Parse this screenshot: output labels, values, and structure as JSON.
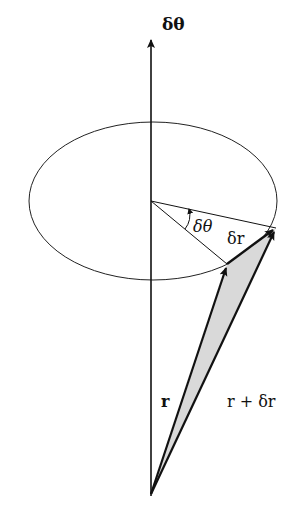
{
  "diagram": {
    "labels": {
      "axis": "δθ",
      "angle": "δθ",
      "delta_r": "δr",
      "r": "r",
      "r_plus_dr": "r + δr"
    },
    "elements": [
      {
        "type": "axis-arrow",
        "label": "δθ",
        "direction": "up"
      },
      {
        "type": "ellipse",
        "description": "circle of rotation in perspective"
      },
      {
        "type": "vector",
        "label": "r",
        "from": "origin",
        "to": "point on circle"
      },
      {
        "type": "vector",
        "label": "r + δr",
        "from": "origin",
        "to": "rotated point on circle"
      },
      {
        "type": "vector",
        "label": "δr",
        "from": "tip of r",
        "to": "tip of r + δr"
      },
      {
        "type": "angle-arc",
        "label": "δθ"
      }
    ],
    "colors": {
      "stroke": "#111111",
      "fill_triangle": "#d9d9d9",
      "background": "#ffffff"
    }
  }
}
